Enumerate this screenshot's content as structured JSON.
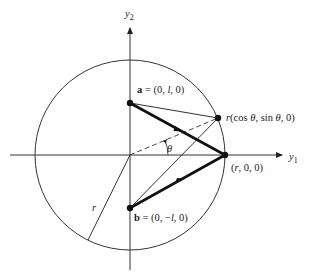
{
  "diagram": {
    "axes": {
      "vertical_label": "y",
      "vertical_sub": "2",
      "horizontal_label": "y",
      "horizontal_sub": "1"
    },
    "points": {
      "a": {
        "name": "a",
        "label": " = (0, ",
        "var": "l",
        "tail": ", 0)"
      },
      "b": {
        "name": "b",
        "label": " = (0, −",
        "var": "l",
        "tail": ", 0)"
      },
      "rotated": {
        "prefix": "r",
        "text": "(cos ",
        "theta1": "θ",
        "mid": ", sin ",
        "theta2": "θ",
        "tail": ", 0)"
      },
      "r_axis": {
        "open": "(",
        "var": "r",
        "tail": ", 0, 0)"
      }
    },
    "angle_label": "θ",
    "radius_label": "r",
    "colors": {
      "stroke": "#222222",
      "background": "#ffffff"
    }
  }
}
